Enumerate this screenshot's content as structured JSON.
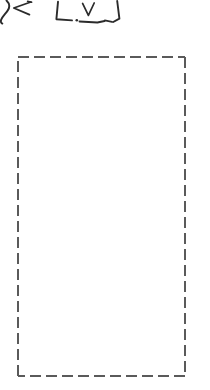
{
  "page": {
    "width": 210,
    "height": 390,
    "background_color": "#ffffff"
  },
  "annotations": {
    "label": "handwritten-ink-marks",
    "ink_color": "#2b2b2b",
    "marks": [
      {
        "name": "curved-stroke-mark",
        "glyph": "partial-curve",
        "x": 0,
        "y": 0,
        "width": 12,
        "height": 24
      },
      {
        "name": "angle-bracket-mark",
        "glyph": "<",
        "x": 12,
        "y": 2,
        "width": 20,
        "height": 14
      },
      {
        "name": "bracket-box-mark",
        "glyph": "open-bracket-box",
        "x": 55,
        "y": 1,
        "width": 65,
        "height": 24
      },
      {
        "name": "vee-mark",
        "glyph": "V",
        "x": 82,
        "y": 3,
        "width": 13,
        "height": 13
      },
      {
        "name": "period-dot-mark",
        "glyph": ".",
        "x": 76,
        "y": 19,
        "width": 2,
        "height": 2
      }
    ]
  },
  "dashed_region": {
    "label": "dashed-selection-region",
    "stroke_color": "#5a5a5a",
    "fill_color": "#ffffff",
    "stroke_width": 2,
    "dash_length": 11,
    "gap_length": 5,
    "x": 17,
    "y": 56,
    "width": 169,
    "height": 321,
    "content": ""
  }
}
